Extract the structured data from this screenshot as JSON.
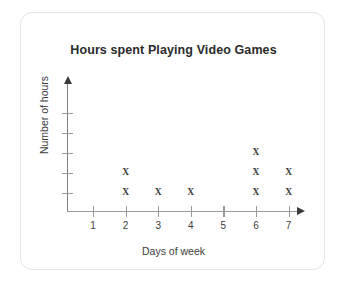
{
  "card": {
    "title": "Hours spent Playing Video Games"
  },
  "chart_data": {
    "type": "scatter",
    "plot_style": "dot-plot",
    "title": "Hours spent Playing Video Games",
    "xlabel": "Days of week",
    "ylabel": "Number of hours",
    "marker": "X",
    "marker_color": "#3a3a3a",
    "axis_color": "#9a9a9a",
    "grid": false,
    "legend": false,
    "categories": [
      "1",
      "2",
      "3",
      "4",
      "5",
      "6",
      "7"
    ],
    "x": [
      1,
      2,
      3,
      4,
      5,
      6,
      7
    ],
    "values": [
      0,
      2,
      1,
      1,
      0,
      3,
      2
    ],
    "xlim": [
      0,
      7.6
    ],
    "ylim": [
      0,
      5
    ],
    "x_tick_labels": [
      "1",
      "2",
      "3",
      "4",
      "5",
      "6",
      "7"
    ],
    "y_tick_labels": [
      "",
      "",
      "",
      "",
      ""
    ],
    "y_tick_count": 5,
    "points": [
      {
        "x": 2,
        "y": 1,
        "marker": "X"
      },
      {
        "x": 2,
        "y": 2,
        "marker": "X"
      },
      {
        "x": 3,
        "y": 1,
        "marker": "X"
      },
      {
        "x": 4,
        "y": 1,
        "marker": "X"
      },
      {
        "x": 6,
        "y": 1,
        "marker": "X"
      },
      {
        "x": 6,
        "y": 2,
        "marker": "X"
      },
      {
        "x": 6,
        "y": 3,
        "marker": "X"
      },
      {
        "x": 7,
        "y": 1,
        "marker": "X"
      },
      {
        "x": 7,
        "y": 2,
        "marker": "X"
      }
    ]
  }
}
